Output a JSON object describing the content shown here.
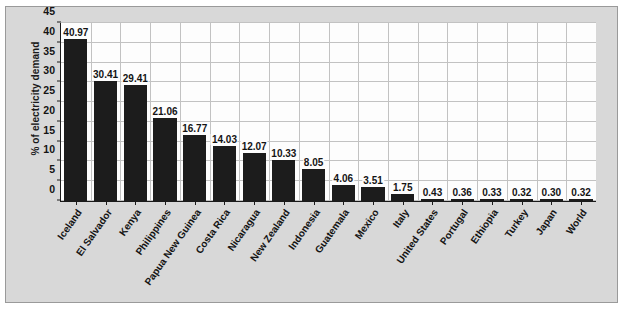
{
  "chart_data": {
    "type": "bar",
    "title": "",
    "xlabel": "",
    "ylabel": "% of electricity demand",
    "ylim": [
      0,
      45
    ],
    "yticks": [
      0,
      5,
      10,
      15,
      20,
      25,
      30,
      35,
      40,
      45
    ],
    "grid": true,
    "legend": "none",
    "bar_color": "#1c1c1c",
    "plot_background": "#fdfdfd",
    "figure_background": "#d8d8d8",
    "gridline_color": "#c2c2c2",
    "axis_color": "#1a1a1a",
    "categories": [
      "Iceland",
      "El Salvador",
      "Kenya",
      "Philippines",
      "Papua New Guinea",
      "Costa Rica",
      "Nicaragua",
      "New Zealand",
      "Indonesia",
      "Guatemala",
      "Mexico",
      "Italy",
      "United States",
      "Portugal",
      "Ethiopia",
      "Turkey",
      "Japan",
      "World"
    ],
    "values": [
      40.97,
      30.41,
      29.41,
      21.06,
      16.77,
      14.03,
      12.07,
      10.33,
      8.05,
      4.06,
      3.51,
      1.75,
      0.43,
      0.36,
      0.33,
      0.32,
      0.3,
      0.32
    ],
    "value_labels": [
      "40.97",
      "30.41",
      "29.41",
      "21.06",
      "16.77",
      "14.03",
      "12.07",
      "10.33",
      "8.05",
      "4.06",
      "3.51",
      "1.75",
      "0.43",
      "0.36",
      "0.33",
      "0.32",
      "0.30",
      "0.32"
    ],
    "ytick_labels": [
      "0",
      "5",
      "10",
      "15",
      "20",
      "25",
      "30",
      "35",
      "40",
      "45"
    ]
  }
}
